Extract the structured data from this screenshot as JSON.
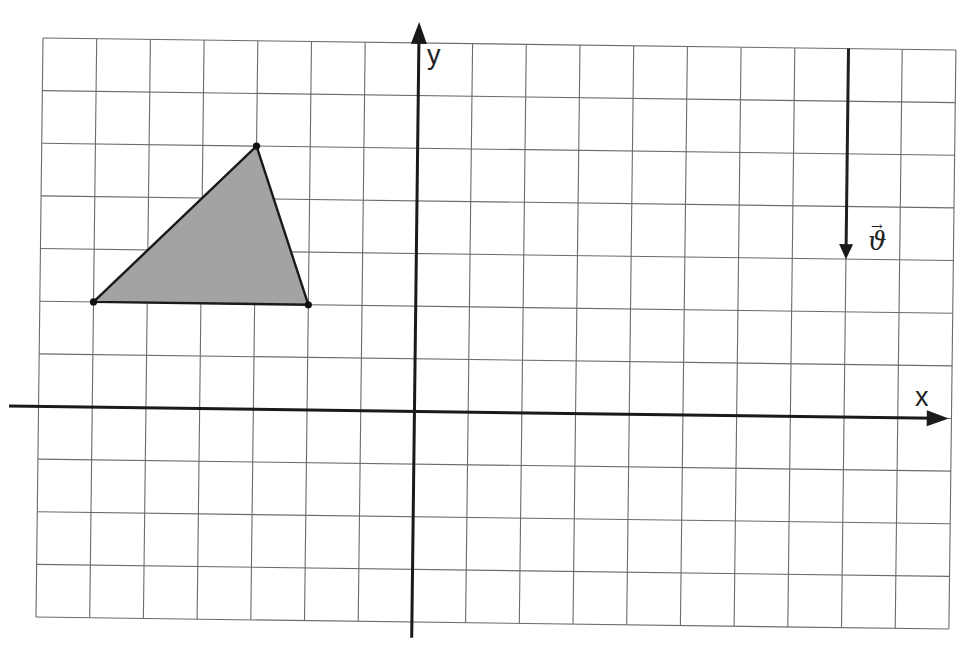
{
  "diagram": {
    "type": "coordinate-grid",
    "grid": {
      "columns": 17,
      "rows": 11,
      "x_range": [
        -7,
        10
      ],
      "y_range": [
        -4,
        7
      ],
      "line_color": "#6b6b6b"
    },
    "axes": {
      "x_label": "x",
      "y_label": "y",
      "origin": [
        0,
        0
      ],
      "color": "#1a1a1a"
    },
    "triangle": {
      "vertices": [
        [
          -6,
          2
        ],
        [
          -3,
          5
        ],
        [
          -2,
          2
        ]
      ],
      "fill_color": "#a3a3a3",
      "stroke_color": "#1a1a1a"
    },
    "vector": {
      "label": "ϑ",
      "label_arrow": "→",
      "start": [
        8,
        7
      ],
      "end": [
        8,
        3
      ],
      "components": [
        0,
        -4
      ]
    }
  }
}
